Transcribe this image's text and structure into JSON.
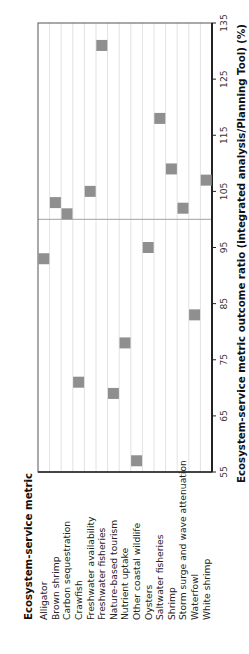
{
  "chart_data": {
    "type": "scatter",
    "orientation": "rotated-90-ccw",
    "title": "",
    "legend_title": "Ecosystem-service metric",
    "xlabel": "Ecosystem-service metric outcome ratio (integrated analysis/Planning Tool) (%)",
    "ylabel": "",
    "xlim": [
      55,
      135
    ],
    "x_ticks": [
      55,
      65,
      75,
      85,
      95,
      105,
      115,
      125,
      135
    ],
    "reference_line": 100,
    "grid": true,
    "categories": [
      "Alligator",
      "Brown shrimp",
      "Carbon sequestration",
      "Crawfish",
      "Freshwater availability",
      "Freshwater fisheries",
      "Nature-based tourism",
      "Nutrient uptake",
      "Other coastal wildlife",
      "Oysters",
      "Saltwater fisheries",
      "Shrimp",
      "Storm surge and wave attenuation",
      "Waterfowl",
      "White shrimp"
    ],
    "values": [
      93,
      103,
      101,
      71,
      105,
      131,
      69,
      78,
      57,
      95,
      118,
      109,
      102,
      83,
      107
    ]
  },
  "colors": {
    "marker": "#8f8f8f",
    "grid": "#e2e2e2",
    "axis": "#222222",
    "reference_line": "#b4b4b4",
    "frame": "#555555"
  }
}
